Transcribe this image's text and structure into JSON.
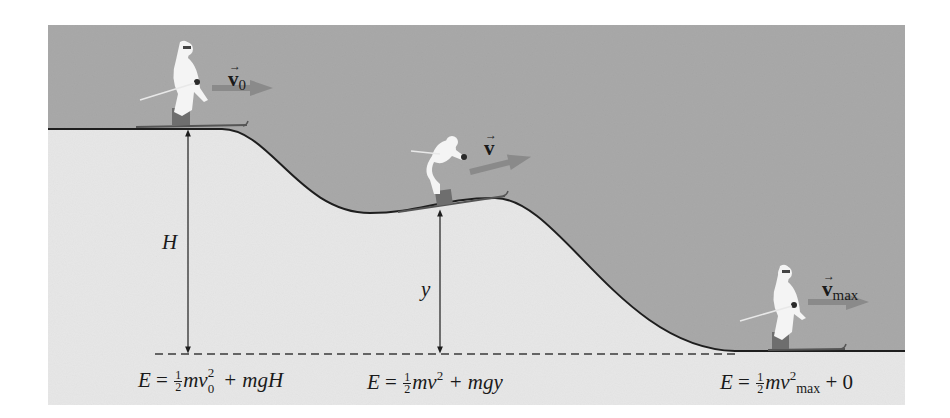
{
  "figure": {
    "colors": {
      "sky": "#a9a9a9",
      "ground": "#e7e7e7",
      "curve": "#1e1e1e",
      "velocity_arrow": "#8a8a8a",
      "text": "#1a1a1a",
      "skier": "#f4f4f4"
    },
    "labels": {
      "height_H": "H",
      "height_y": "y",
      "v0_symbol": "v",
      "v0_sub": "0",
      "v_symbol": "v",
      "vmax_symbol": "v",
      "vmax_sub": "max",
      "vec_arrow": "→"
    },
    "equations": [
      {
        "position": "top",
        "lhs": "E =",
        "frac_num": "1",
        "frac_den": "2",
        "term1": "mv",
        "sup": "2",
        "sub": "0",
        "rest": "+ mgH",
        "full": "E = ½mv₀² + mgH"
      },
      {
        "position": "middle",
        "lhs": "E =",
        "frac_num": "1",
        "frac_den": "2",
        "term1": "mv",
        "sup": "2",
        "rest": "+ mgy",
        "full": "E = ½mv² + mgy"
      },
      {
        "position": "bottom",
        "lhs": "E =",
        "frac_num": "1",
        "frac_den": "2",
        "term1": "mv",
        "sup": "2",
        "sub": "max",
        "rest": "+ 0",
        "full": "E = ½mv²max + 0"
      }
    ],
    "skiers": [
      {
        "name": "skier-top",
        "velocity": "v0"
      },
      {
        "name": "skier-middle",
        "velocity": "v"
      },
      {
        "name": "skier-bottom",
        "velocity": "vmax"
      }
    ]
  }
}
